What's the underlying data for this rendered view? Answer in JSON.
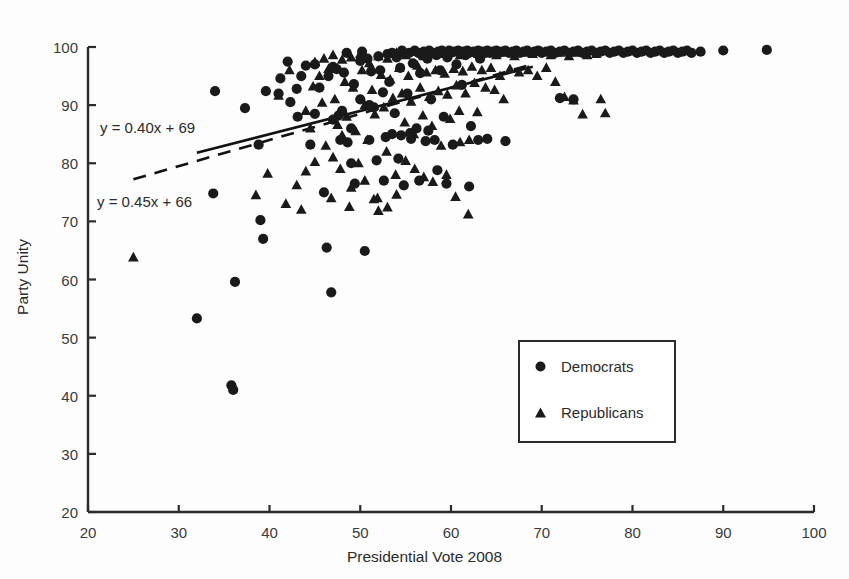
{
  "chart_data": {
    "type": "scatter",
    "title": "",
    "xlabel": "Presidential Vote 2008",
    "ylabel": "Party Unity",
    "xlim": [
      20,
      100
    ],
    "ylim": [
      20,
      100
    ],
    "xticks": [
      20,
      30,
      40,
      50,
      60,
      70,
      80,
      90,
      100
    ],
    "yticks": [
      20,
      30,
      40,
      50,
      60,
      70,
      80,
      90,
      100
    ],
    "grid": false,
    "legend_position": "center-right",
    "marker_color": "#1a1a1a",
    "annotations": [
      {
        "text": "y = 0.40x + 69",
        "series": "Democrats",
        "style": "solid"
      },
      {
        "text": "y = 0.45x + 66",
        "series": "Republicans",
        "style": "dashed"
      }
    ],
    "trendlines": [
      {
        "name": "Democrats",
        "style": "solid",
        "slope": 0.4,
        "intercept": 69,
        "x_start": 32,
        "x_end": 69
      },
      {
        "name": "Republicans",
        "style": "dashed",
        "slope": 0.45,
        "intercept": 66,
        "x_start": 25,
        "x_end": 69
      }
    ],
    "series": [
      {
        "name": "Democrats",
        "marker": "circle",
        "points": [
          [
            32,
            53.3
          ],
          [
            33.8,
            74.8
          ],
          [
            35.8,
            41.8
          ],
          [
            36.0,
            41.0
          ],
          [
            36.2,
            59.6
          ],
          [
            34.0,
            92.4
          ],
          [
            37.3,
            89.5
          ],
          [
            38.8,
            83.2
          ],
          [
            39.6,
            92.4
          ],
          [
            39.3,
            67.0
          ],
          [
            39.0,
            70.2
          ],
          [
            41.2,
            94.6
          ],
          [
            42.3,
            90.5
          ],
          [
            43.0,
            92.8
          ],
          [
            43.1,
            88.0
          ],
          [
            44.5,
            83.2
          ],
          [
            45.0,
            97.0
          ],
          [
            45.5,
            93.0
          ],
          [
            46.0,
            75.0
          ],
          [
            46.3,
            65.5
          ],
          [
            46.8,
            57.8
          ],
          [
            47.0,
            96.6
          ],
          [
            47.4,
            96.2
          ],
          [
            47.6,
            88.2
          ],
          [
            47.8,
            84.0
          ],
          [
            48.2,
            95.6
          ],
          [
            48.5,
            99.0
          ],
          [
            48.6,
            83.6
          ],
          [
            49.0,
            86.0
          ],
          [
            49.3,
            93.6
          ],
          [
            49.4,
            76.5
          ],
          [
            50.0,
            97.6
          ],
          [
            50.2,
            99.2
          ],
          [
            50.5,
            64.9
          ],
          [
            50.8,
            98.0
          ],
          [
            51.0,
            84.0
          ],
          [
            51.2,
            95.8
          ],
          [
            51.5,
            89.6
          ],
          [
            51.8,
            80.5
          ],
          [
            52.0,
            98.4
          ],
          [
            52.2,
            96.0
          ],
          [
            52.5,
            92.2
          ],
          [
            52.6,
            77.0
          ],
          [
            52.8,
            84.5
          ],
          [
            53.0,
            98.8
          ],
          [
            53.2,
            94.0
          ],
          [
            53.5,
            99.0
          ],
          [
            53.8,
            88.6
          ],
          [
            54.0,
            98.2
          ],
          [
            54.2,
            80.8
          ],
          [
            54.4,
            96.4
          ],
          [
            54.6,
            99.4
          ],
          [
            54.8,
            76.2
          ],
          [
            55.0,
            98.8
          ],
          [
            55.2,
            92.0
          ],
          [
            55.4,
            99.0
          ],
          [
            55.6,
            84.2
          ],
          [
            55.8,
            97.2
          ],
          [
            56.0,
            99.4
          ],
          [
            56.2,
            86.0
          ],
          [
            56.4,
            99.0
          ],
          [
            56.6,
            95.5
          ],
          [
            56.8,
            98.6
          ],
          [
            57.0,
            99.2
          ],
          [
            57.2,
            83.8
          ],
          [
            57.4,
            98.0
          ],
          [
            57.6,
            99.4
          ],
          [
            57.8,
            91.0
          ],
          [
            58.0,
            99.0
          ],
          [
            58.2,
            84.0
          ],
          [
            58.4,
            98.6
          ],
          [
            58.6,
            99.2
          ],
          [
            58.8,
            96.0
          ],
          [
            59.0,
            99.4
          ],
          [
            59.2,
            88.0
          ],
          [
            59.4,
            99.0
          ],
          [
            59.6,
            98.2
          ],
          [
            59.8,
            99.4
          ],
          [
            60.0,
            99.0
          ],
          [
            60.2,
            83.2
          ],
          [
            60.4,
            99.2
          ],
          [
            60.6,
            97.0
          ],
          [
            60.8,
            99.4
          ],
          [
            61.0,
            99.0
          ],
          [
            61.2,
            93.5
          ],
          [
            61.4,
            99.2
          ],
          [
            61.6,
            98.6
          ],
          [
            61.8,
            99.4
          ],
          [
            62.0,
            99.0
          ],
          [
            62.2,
            86.4
          ],
          [
            62.5,
            99.2
          ],
          [
            62.8,
            99.0
          ],
          [
            63.0,
            99.4
          ],
          [
            63.2,
            98.0
          ],
          [
            63.5,
            99.2
          ],
          [
            63.8,
            99.0
          ],
          [
            64.0,
            99.4
          ],
          [
            64.3,
            99.0
          ],
          [
            64.6,
            99.2
          ],
          [
            65.0,
            99.4
          ],
          [
            65.3,
            99.0
          ],
          [
            65.6,
            99.2
          ],
          [
            66.0,
            99.4
          ],
          [
            66.4,
            99.0
          ],
          [
            66.8,
            99.2
          ],
          [
            67.2,
            99.4
          ],
          [
            67.6,
            99.0
          ],
          [
            68.0,
            99.2
          ],
          [
            68.4,
            99.4
          ],
          [
            68.8,
            99.0
          ],
          [
            69.2,
            99.2
          ],
          [
            69.6,
            99.4
          ],
          [
            70.0,
            99.0
          ],
          [
            70.5,
            99.2
          ],
          [
            71.0,
            99.4
          ],
          [
            71.5,
            99.0
          ],
          [
            72.0,
            99.2
          ],
          [
            72.5,
            99.4
          ],
          [
            73.0,
            99.0
          ],
          [
            73.5,
            99.2
          ],
          [
            74.0,
            99.4
          ],
          [
            74.5,
            99.0
          ],
          [
            75.0,
            99.2
          ],
          [
            75.5,
            99.4
          ],
          [
            76.0,
            99.0
          ],
          [
            76.5,
            99.2
          ],
          [
            77.0,
            99.4
          ],
          [
            77.5,
            99.0
          ],
          [
            78.0,
            99.2
          ],
          [
            78.5,
            99.4
          ],
          [
            79.0,
            99.0
          ],
          [
            79.5,
            99.2
          ],
          [
            80.0,
            99.4
          ],
          [
            80.5,
            99.0
          ],
          [
            81.0,
            99.2
          ],
          [
            81.5,
            99.4
          ],
          [
            82.0,
            99.0
          ],
          [
            82.5,
            99.2
          ],
          [
            83.0,
            99.4
          ],
          [
            83.5,
            99.0
          ],
          [
            84.0,
            99.2
          ],
          [
            84.5,
            99.4
          ],
          [
            85.0,
            99.0
          ],
          [
            85.5,
            99.2
          ],
          [
            86.0,
            99.4
          ],
          [
            86.5,
            99.0
          ],
          [
            87.5,
            99.2
          ],
          [
            90.0,
            99.4
          ],
          [
            94.8,
            99.5
          ],
          [
            53.5,
            85.0
          ],
          [
            54.5,
            84.8
          ],
          [
            55.5,
            85.2
          ],
          [
            56.5,
            77.0
          ],
          [
            57.5,
            85.6
          ],
          [
            58.5,
            78.8
          ],
          [
            59.5,
            76.5
          ],
          [
            62.0,
            76.0
          ],
          [
            63.0,
            84.0
          ],
          [
            64.0,
            84.2
          ],
          [
            66.0,
            83.8
          ],
          [
            72.0,
            91.2
          ],
          [
            73.5,
            91.0
          ],
          [
            50.0,
            91.0
          ],
          [
            51.0,
            90.0
          ],
          [
            49.0,
            80.0
          ],
          [
            48.0,
            89.0
          ],
          [
            47.0,
            87.5
          ],
          [
            46.5,
            95.0
          ],
          [
            45.0,
            88.5
          ],
          [
            44.0,
            96.8
          ],
          [
            43.5,
            95.0
          ],
          [
            42.0,
            97.5
          ],
          [
            41.0,
            92.0
          ]
        ]
      },
      {
        "name": "Republicans",
        "marker": "triangle",
        "points": [
          [
            25.0,
            63.8
          ],
          [
            38.5,
            74.5
          ],
          [
            39.8,
            78.2
          ],
          [
            41.0,
            91.6
          ],
          [
            41.8,
            73.0
          ],
          [
            42.2,
            96.0
          ],
          [
            43.0,
            76.2
          ],
          [
            43.5,
            72.0
          ],
          [
            44.0,
            89.0
          ],
          [
            44.5,
            86.0
          ],
          [
            44.8,
            93.2
          ],
          [
            45.0,
            97.4
          ],
          [
            45.5,
            95.0
          ],
          [
            45.8,
            90.4
          ],
          [
            46.0,
            98.0
          ],
          [
            46.2,
            83.0
          ],
          [
            46.5,
            96.2
          ],
          [
            46.8,
            74.0
          ],
          [
            47.0,
            98.6
          ],
          [
            47.2,
            91.0
          ],
          [
            47.5,
            86.6
          ],
          [
            47.8,
            79.0
          ],
          [
            48.0,
            97.8
          ],
          [
            48.3,
            94.0
          ],
          [
            48.5,
            88.0
          ],
          [
            48.8,
            72.5
          ],
          [
            49.0,
            98.2
          ],
          [
            49.2,
            93.0
          ],
          [
            49.5,
            85.5
          ],
          [
            49.8,
            80.0
          ],
          [
            50.0,
            98.8
          ],
          [
            50.2,
            96.0
          ],
          [
            50.5,
            90.0
          ],
          [
            50.8,
            84.0
          ],
          [
            51.0,
            97.2
          ],
          [
            51.3,
            92.6
          ],
          [
            51.6,
            88.4
          ],
          [
            51.9,
            74.0
          ],
          [
            52.0,
            98.4
          ],
          [
            52.3,
            95.2
          ],
          [
            52.6,
            89.6
          ],
          [
            52.9,
            82.0
          ],
          [
            53.0,
            98.0
          ],
          [
            53.3,
            94.4
          ],
          [
            53.6,
            91.2
          ],
          [
            53.9,
            78.0
          ],
          [
            54.0,
            99.0
          ],
          [
            54.3,
            96.4
          ],
          [
            54.6,
            92.0
          ],
          [
            54.9,
            87.0
          ],
          [
            55.0,
            98.6
          ],
          [
            55.3,
            95.0
          ],
          [
            55.6,
            90.6
          ],
          [
            55.9,
            85.0
          ],
          [
            56.0,
            99.2
          ],
          [
            56.3,
            96.8
          ],
          [
            56.6,
            93.0
          ],
          [
            56.9,
            88.2
          ],
          [
            57.0,
            98.4
          ],
          [
            57.3,
            95.6
          ],
          [
            57.6,
            91.4
          ],
          [
            57.9,
            86.4
          ],
          [
            58.0,
            99.0
          ],
          [
            58.3,
            96.0
          ],
          [
            58.6,
            92.4
          ],
          [
            58.9,
            83.0
          ],
          [
            59.0,
            98.8
          ],
          [
            59.3,
            95.4
          ],
          [
            59.6,
            91.8
          ],
          [
            59.9,
            87.6
          ],
          [
            60.0,
            99.2
          ],
          [
            60.3,
            96.2
          ],
          [
            60.6,
            93.4
          ],
          [
            60.9,
            89.0
          ],
          [
            61.0,
            98.6
          ],
          [
            61.3,
            95.8
          ],
          [
            61.6,
            92.0
          ],
          [
            61.9,
            71.2
          ],
          [
            62.0,
            99.0
          ],
          [
            62.3,
            96.6
          ],
          [
            62.6,
            93.8
          ],
          [
            62.9,
            88.8
          ],
          [
            63.0,
            98.8
          ],
          [
            63.4,
            96.0
          ],
          [
            63.8,
            93.0
          ],
          [
            64.0,
            99.2
          ],
          [
            64.4,
            96.4
          ],
          [
            64.8,
            92.6
          ],
          [
            65.0,
            98.6
          ],
          [
            65.4,
            95.0
          ],
          [
            65.8,
            91.0
          ],
          [
            66.0,
            99.0
          ],
          [
            66.5,
            96.2
          ],
          [
            67.0,
            98.4
          ],
          [
            67.5,
            95.6
          ],
          [
            68.0,
            99.0
          ],
          [
            68.5,
            96.0
          ],
          [
            69.0,
            98.8
          ],
          [
            69.5,
            95.0
          ],
          [
            70.0,
            99.2
          ],
          [
            70.5,
            96.4
          ],
          [
            71.0,
            98.6
          ],
          [
            71.5,
            94.0
          ],
          [
            72.0,
            99.0
          ],
          [
            72.5,
            91.4
          ],
          [
            73.0,
            98.4
          ],
          [
            73.5,
            90.8
          ],
          [
            74.0,
            99.0
          ],
          [
            74.5,
            88.4
          ],
          [
            75.0,
            98.6
          ],
          [
            76.0,
            98.8
          ],
          [
            77.0,
            88.6
          ],
          [
            76.5,
            91.0
          ],
          [
            56.0,
            79.0
          ],
          [
            57.0,
            77.6
          ],
          [
            58.0,
            76.8
          ],
          [
            59.5,
            78.0
          ],
          [
            60.5,
            74.2
          ],
          [
            61.0,
            83.6
          ],
          [
            62.0,
            84.0
          ],
          [
            50.5,
            77.0
          ],
          [
            51.5,
            73.8
          ],
          [
            52.0,
            71.8
          ],
          [
            53.0,
            72.4
          ],
          [
            54.0,
            74.6
          ],
          [
            55.0,
            80.4
          ],
          [
            49.0,
            75.8
          ],
          [
            48.0,
            84.8
          ],
          [
            47.0,
            81.0
          ],
          [
            45.0,
            80.2
          ],
          [
            44.0,
            78.6
          ]
        ]
      }
    ]
  },
  "legend": {
    "entries": [
      {
        "label": "Democrats",
        "marker": "circle"
      },
      {
        "label": "Republicans",
        "marker": "triangle"
      }
    ]
  }
}
